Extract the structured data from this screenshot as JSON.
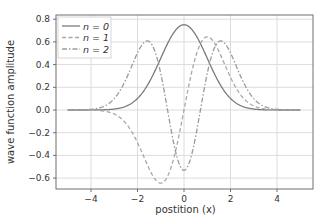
{
  "chart_data": {
    "type": "line",
    "title": "",
    "xlabel": "postition (x)",
    "ylabel": "wave function amplitude",
    "xlim": [
      -5.5,
      5.6
    ],
    "ylim": [
      -0.7,
      0.82
    ],
    "xticks": [
      -4,
      -2,
      0,
      2,
      4
    ],
    "xtick_labels": [
      "−4",
      "−2",
      "0",
      "2",
      "4"
    ],
    "yticks": [
      0.8,
      0.6,
      0.4,
      0.2,
      0.0,
      -0.2,
      -0.4,
      -0.6
    ],
    "ytick_labels": [
      "0.8",
      "0.6",
      "0.4",
      "0.2",
      "0.0",
      "−0.2",
      "−0.4",
      "−0.6"
    ],
    "grid": true,
    "legend_position": "upper left",
    "x_range": [
      -5,
      5
    ],
    "series": [
      {
        "name": "n = 0",
        "style": "solid",
        "color": "#7a7a7a",
        "description": "harmonic oscillator ground state, Gaussian peak 0.75 at x=0",
        "x": [
          -5,
          -4,
          -3,
          -2,
          -1.5,
          -1,
          -0.5,
          0,
          0.5,
          1,
          1.5,
          2,
          3,
          4,
          5
        ],
        "values": [
          0.0,
          0.0003,
          0.0083,
          0.1016,
          0.2439,
          0.4556,
          0.6628,
          0.7511,
          0.6628,
          0.4556,
          0.2439,
          0.1016,
          0.0083,
          0.0003,
          0.0
        ]
      },
      {
        "name": "n = 1",
        "style": "dashed",
        "color": "#a8a8a8",
        "description": "first excited state, min -0.64 at x=-1, max 0.64 at x=1",
        "x": [
          -5,
          -4,
          -3,
          -2,
          -1.5,
          -1,
          -0.5,
          0,
          0.5,
          1,
          1.5,
          2,
          3,
          4,
          5
        ],
        "values": [
          0.0,
          -0.0019,
          -0.0354,
          -0.2874,
          -0.5174,
          -0.6443,
          -0.4687,
          0.0,
          0.4687,
          0.6443,
          0.5174,
          0.2874,
          0.0354,
          0.0019,
          0.0
        ]
      },
      {
        "name": "n = 2",
        "style": "dashdot",
        "color": "#9a9a9a",
        "description": "second excited state, peaks 0.63 near x=±1.65, min -0.53 at x=0",
        "x": [
          -5,
          -4,
          -3,
          -2,
          -1.5,
          -1,
          -0.5,
          0,
          0.5,
          1,
          1.5,
          2,
          3,
          4,
          5
        ],
        "values": [
          0.0,
          0.0057,
          0.1001,
          0.5029,
          0.6069,
          0.3222,
          -0.2344,
          -0.5311,
          -0.2344,
          0.3222,
          0.6069,
          0.5029,
          0.1001,
          0.0057,
          0.0
        ]
      }
    ],
    "legend": [
      {
        "label": "n = 0",
        "style": "solid"
      },
      {
        "label": "n = 1",
        "style": "dashed"
      },
      {
        "label": "n = 2",
        "style": "dashdot"
      }
    ],
    "colors": {
      "axes_frame": "#6e6e6e",
      "grid": "#dcdcdc",
      "text": "#333333",
      "legend_border": "#cccccc"
    }
  }
}
